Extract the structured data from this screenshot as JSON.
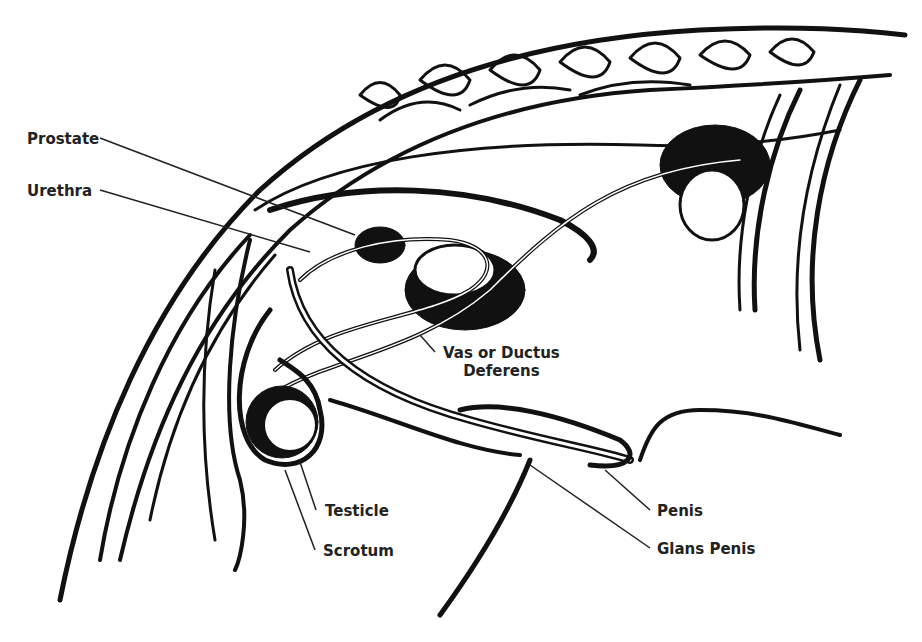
{
  "diagram": {
    "type": "anatomical-illustration",
    "colors": {
      "ink": "#111111",
      "background": "#ffffff",
      "label": "#222222"
    }
  },
  "labels": {
    "prostate": "Prostate",
    "urethra": "Urethra",
    "vas_line1": "Vas or Ductus",
    "vas_line2": "Deferens",
    "testicle": "Testicle",
    "scrotum": "Scrotum",
    "penis": "Penis",
    "glans_penis": "Glans Penis"
  }
}
